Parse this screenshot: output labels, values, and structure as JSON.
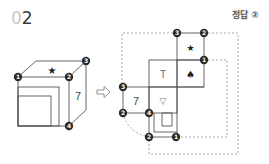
{
  "header": {
    "question_number_lead": "0",
    "question_number": "2",
    "answer_label": "정답 ②"
  },
  "left_cube": {
    "top_face_symbol": "★",
    "right_face_symbol": "7",
    "badges": [
      "1",
      "2",
      "3",
      "4"
    ]
  },
  "arrow": {
    "icon": "hollow-right-arrow-icon",
    "glyph": "⇨"
  },
  "net": {
    "faces": [
      {
        "id": "star",
        "symbol": "★"
      },
      {
        "id": "t",
        "symbol": "T"
      },
      {
        "id": "spade",
        "symbol": "♠"
      },
      {
        "id": "seven",
        "symbol": "7"
      },
      {
        "id": "triangle",
        "symbol": "▽"
      },
      {
        "id": "nested-square",
        "symbol": ""
      }
    ],
    "badges": {
      "top_left": "3",
      "top_right": "2",
      "right_mid": "1",
      "left_top": "3",
      "left_bottom": "2",
      "center": "4",
      "bottom_left": "2",
      "bottom_right": "1"
    }
  },
  "colors": {
    "line": "#555555",
    "badge": "#2b2b2b",
    "dash": "#888888"
  }
}
